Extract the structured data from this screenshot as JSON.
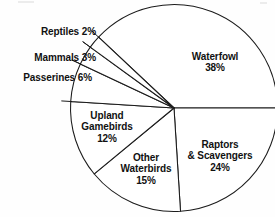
{
  "chart_data": {
    "type": "pie",
    "title": "",
    "subtitle": "",
    "xlabel": "",
    "ylabel": "",
    "legend_position": "none",
    "grid": false,
    "units": "percent",
    "total": 100,
    "categories": [
      "Waterfowl",
      "Raptors & Scavengers",
      "Other Waterbirds",
      "Upland Gamebirds",
      "Passerines",
      "Mammals",
      "Reptiles"
    ],
    "values": [
      38,
      24,
      15,
      12,
      6,
      3,
      2
    ],
    "slices": [
      {
        "name": "Waterfowl",
        "value": 38,
        "label_line1": "Waterfowl",
        "label_line2": "38%",
        "label_placement": "inside",
        "start_angle": 223.2,
        "end_angle": 360.0,
        "color": "#ffffff",
        "outline": "#1b1b1b"
      },
      {
        "name": "Raptors & Scavengers",
        "value": 24,
        "label_line1": "Raptors",
        "label_line2": "& Scavengers",
        "label_line3": "24%",
        "label_placement": "inside",
        "start_angle": 0.0,
        "end_angle": 86.4,
        "color": "#ffffff",
        "outline": "#1b1b1b"
      },
      {
        "name": "Other Waterbirds",
        "value": 15,
        "label_line1": "Other",
        "label_line2": "Waterbirds",
        "label_line3": "15%",
        "label_placement": "inside",
        "start_angle": 86.4,
        "end_angle": 140.4,
        "color": "#ffffff",
        "outline": "#1b1b1b"
      },
      {
        "name": "Upland Gamebirds",
        "value": 12,
        "label_line1": "Upland",
        "label_line2": "Gamebirds",
        "label_line3": "12%",
        "label_placement": "inside",
        "start_angle": 140.4,
        "end_angle": 183.6,
        "color": "#ffffff",
        "outline": "#1b1b1b"
      },
      {
        "name": "Passerines",
        "value": 6,
        "label_line1": "Passerines 6%",
        "label_placement": "outside",
        "start_angle": 183.6,
        "end_angle": 205.2,
        "color": "#ffffff",
        "outline": "#1b1b1b"
      },
      {
        "name": "Mammals",
        "value": 3,
        "label_line1": "Mammals 3%",
        "label_placement": "outside",
        "start_angle": 205.2,
        "end_angle": 216.0,
        "color": "#ffffff",
        "outline": "#1b1b1b"
      },
      {
        "name": "Reptiles",
        "value": 2,
        "label_line1": "Reptiles 2%",
        "label_placement": "outside",
        "start_angle": 216.0,
        "end_angle": 223.2,
        "color": "#ffffff",
        "outline": "#1b1b1b"
      }
    ]
  },
  "labels": {
    "waterfowl_name": "Waterfowl",
    "waterfowl_pct": "38%",
    "raptors_name_1": "Raptors",
    "raptors_name_2": "& Scavengers",
    "raptors_pct": "24%",
    "otherwater_name_1": "Other",
    "otherwater_name_2": "Waterbirds",
    "otherwater_pct": "15%",
    "upland_name_1": "Upland",
    "upland_name_2": "Gamebirds",
    "upland_pct": "12%",
    "passerines": "Passerines 6%",
    "mammals": "Mammals 3%",
    "reptiles": "Reptiles 2%"
  },
  "geometry": {
    "center_x": 174,
    "center_y": 108,
    "radius": 103.5
  },
  "colors": {
    "outline": "#1b1b1b",
    "slice_fill": "#ffffff",
    "text": "#111111",
    "background": "#fefefe"
  }
}
